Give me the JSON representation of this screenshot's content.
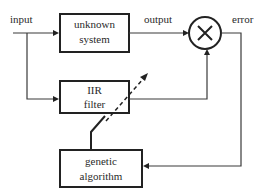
{
  "diagram": {
    "signals": {
      "input": "input",
      "output": "output",
      "error": "error"
    },
    "blocks": {
      "unknown_system": [
        "unknown",
        "system"
      ],
      "iir_filter": [
        "IIR",
        "filter"
      ],
      "genetic_algorithm": [
        "genetic",
        "algorithm"
      ]
    },
    "sum_junction_symbol": "×"
  }
}
